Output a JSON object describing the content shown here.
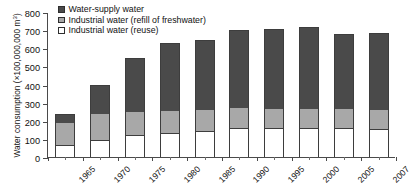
{
  "chart_data": {
    "type": "bar",
    "subtype": "stacked",
    "title": "",
    "xlabel": "",
    "ylabel": "Water consumption (×100,000,000 m³)",
    "ylim": [
      0,
      800
    ],
    "ytick_interval": 100,
    "yticks": [
      "0",
      "100",
      "200",
      "300",
      "400",
      "500",
      "600",
      "700",
      "800"
    ],
    "grid": false,
    "legend_position": "top-left-inside",
    "categories": [
      "1965",
      "1970",
      "1975",
      "1980",
      "1985",
      "1990",
      "1995",
      "2000",
      "2005",
      "2007"
    ],
    "series": [
      {
        "name": "Industrial water (reuse)",
        "color": "#ffffff",
        "values": [
          65,
          95,
          120,
          130,
          145,
          160,
          160,
          160,
          160,
          155
        ]
      },
      {
        "name": "Industrial water (refill of freshwater)",
        "color": "#a8a8a8",
        "values": [
          125,
          145,
          130,
          125,
          115,
          110,
          105,
          105,
          105,
          105
        ]
      },
      {
        "name": "Water-supply water",
        "color": "#4a4a4a",
        "values": [
          45,
          160,
          295,
          375,
          385,
          430,
          440,
          450,
          415,
          425
        ]
      }
    ],
    "totals": [
      235,
      400,
      545,
      630,
      645,
      700,
      705,
      715,
      680,
      685
    ]
  },
  "legend": {
    "items": [
      {
        "label": "Water-supply water",
        "swatch": "supply"
      },
      {
        "label": "Industrial water (refill of  freshwater)",
        "swatch": "refill"
      },
      {
        "label": "Industrial water (reuse)",
        "swatch": "reuse"
      }
    ]
  },
  "axis": {
    "y_title_main": "Water consumption (×100,000,000 m",
    "y_title_sup": "3",
    "y_title_tail": ")"
  }
}
